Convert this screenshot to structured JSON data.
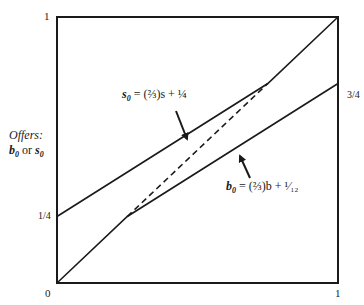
{
  "chart_data": {
    "type": "line",
    "title": "",
    "xlabel": "",
    "ylabel": "Offers: b0 or s0",
    "xlim": [
      0,
      1
    ],
    "ylim": [
      0,
      1
    ],
    "grid": false,
    "x_ticks": [
      "0",
      "1"
    ],
    "y_ticks": [
      "0",
      "1/4",
      "1"
    ],
    "right_tick": "3/4",
    "series": [
      {
        "name": "s0 = (2/3)s + 1/4",
        "style": "solid",
        "points": [
          [
            0,
            0.25
          ],
          [
            0.75,
            0.75
          ],
          [
            1,
            1
          ]
        ]
      },
      {
        "name": "b0 = (2/3)b + 1/12",
        "style": "solid",
        "points": [
          [
            0,
            0
          ],
          [
            0.25,
            0.25
          ],
          [
            1,
            0.75
          ]
        ]
      },
      {
        "name": "connector",
        "style": "dashed",
        "points": [
          [
            0.25,
            0.25
          ],
          [
            0.75,
            0.75
          ]
        ]
      }
    ],
    "annotations": [
      {
        "text": "s0 = (2/3)s + 1/4",
        "arrow_to": [
          0.5,
          0.583
        ]
      },
      {
        "text": "b0 = (2/3)b + 1/12",
        "arrow_to": [
          0.5,
          0.417
        ]
      }
    ]
  },
  "labels": {
    "y_top": "1",
    "y_quarter": "1/4",
    "origin": "0",
    "x_right": "1",
    "right_three_quarter": "3/4",
    "ylabel_line1": "Offers:",
    "ylabel_b": "b",
    "ylabel_sub0": "0",
    "ylabel_or": "or",
    "ylabel_s": "s",
    "eq_s_var": "s",
    "eq_s_sub": "0",
    "eq_s_rest": " = (⅔)s + ¼",
    "eq_b_var": "b",
    "eq_b_sub": "0",
    "eq_b_rest": " = (⅔)b + ¹⁄₁₂"
  },
  "colors": {
    "line": "#1a1a1a",
    "background": "#ffffff"
  }
}
